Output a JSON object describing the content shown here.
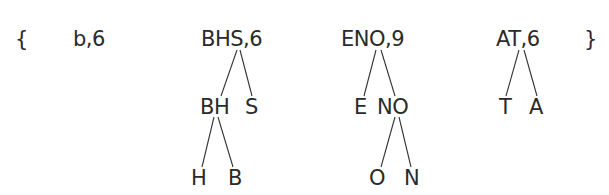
{
  "diagram": {
    "open_brace": "{",
    "close_brace": "}",
    "colors": {
      "text": "#2a2a2a",
      "edge": "#333333",
      "background": "#ffffff"
    },
    "trees": [
      {
        "root": "b,6",
        "children": []
      },
      {
        "root": "BHS,6",
        "children": [
          {
            "label": "BH",
            "children": [
              {
                "label": "H"
              },
              {
                "label": "B"
              }
            ]
          },
          {
            "label": "S"
          }
        ]
      },
      {
        "root": "ENO,9",
        "children": [
          {
            "label": "E"
          },
          {
            "label": "NO",
            "children": [
              {
                "label": "O"
              },
              {
                "label": "N"
              }
            ]
          }
        ]
      },
      {
        "root": "AT,6",
        "children": [
          {
            "label": "T"
          },
          {
            "label": "A"
          }
        ]
      }
    ]
  }
}
